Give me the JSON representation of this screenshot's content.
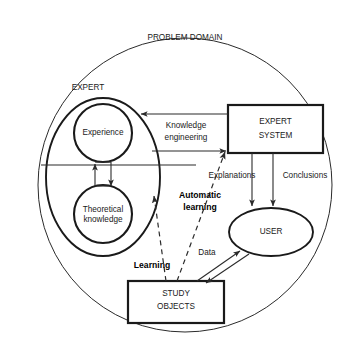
{
  "diagram": {
    "background_color": "#ffffff",
    "stroke_color": "#2b2b2b",
    "containers": {
      "problem_domain": {
        "label": "PROBLEM DOMAIN",
        "shape": "circle"
      },
      "expert": {
        "label": "EXPERT",
        "shape": "ellipse"
      }
    },
    "nodes": {
      "experience": {
        "label": "Experience",
        "shape": "circle"
      },
      "theoretical_knowledge": {
        "label_line1": "Theoretical",
        "label_line2": "knowledge",
        "shape": "circle"
      },
      "expert_system": {
        "label_line1": "EXPERT",
        "label_line2": "SYSTEM",
        "shape": "rectangle"
      },
      "user": {
        "label": "USER",
        "shape": "ellipse"
      },
      "study_objects": {
        "label_line1": "STUDY",
        "label_line2": "OBJECTS",
        "shape": "rectangle"
      }
    },
    "edge_labels": {
      "knowledge_engineering_line1": "Knowledge",
      "knowledge_engineering_line2": "engineering",
      "explanations": "Explanations",
      "conclusions": "Conclusions",
      "automatic_learning_line1": "Automatic",
      "automatic_learning_line2": "learning",
      "learning": "Learning",
      "data": "Data"
    }
  }
}
